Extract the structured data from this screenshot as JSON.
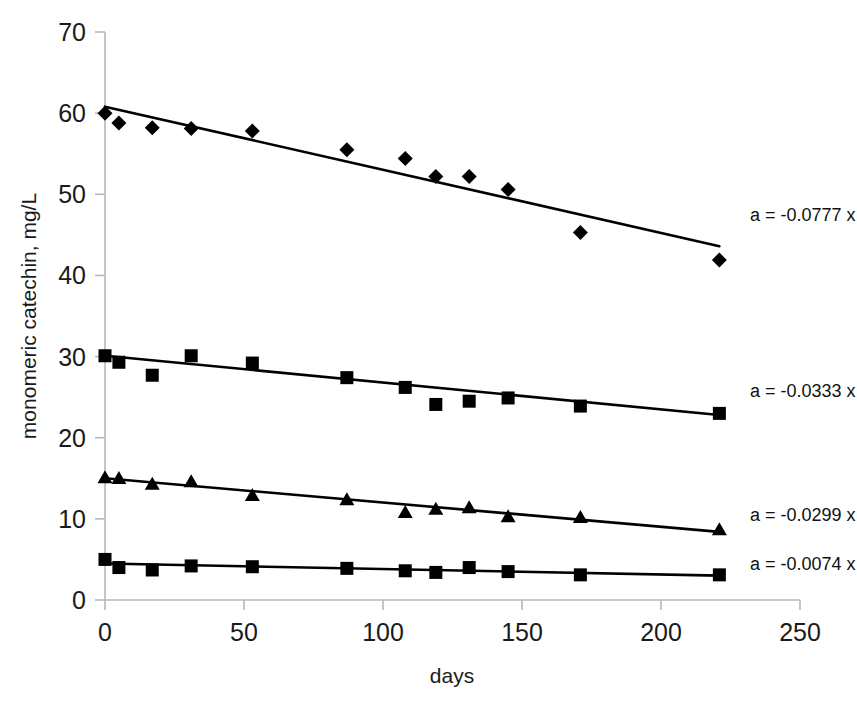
{
  "chart_data": {
    "type": "scatter",
    "title": "",
    "xlabel": "days",
    "ylabel": "monomeric catechin, mg/L",
    "xlim": [
      0,
      250
    ],
    "ylim": [
      0,
      70
    ],
    "xticks": [
      0,
      50,
      100,
      150,
      200,
      250
    ],
    "yticks": [
      0,
      10,
      20,
      30,
      40,
      50,
      60,
      70
    ],
    "grid": false,
    "legend": "none",
    "series": [
      {
        "name": "series-diamond",
        "marker": "diamond",
        "annotation": "a = -0.0777 x",
        "slope": -0.0777,
        "intercept": 60.8,
        "fit_x": [
          0,
          221
        ],
        "fit_y": [
          60.8,
          43.6
        ],
        "points": [
          {
            "x": 0,
            "y": 60.0
          },
          {
            "x": 5,
            "y": 58.8
          },
          {
            "x": 17,
            "y": 58.2
          },
          {
            "x": 31,
            "y": 58.1
          },
          {
            "x": 53,
            "y": 57.8
          },
          {
            "x": 87,
            "y": 55.5
          },
          {
            "x": 108,
            "y": 54.4
          },
          {
            "x": 119,
            "y": 52.2
          },
          {
            "x": 131,
            "y": 52.2
          },
          {
            "x": 145,
            "y": 50.6
          },
          {
            "x": 171,
            "y": 45.3
          },
          {
            "x": 221,
            "y": 41.9
          }
        ]
      },
      {
        "name": "series-square-upper",
        "marker": "square",
        "annotation": "a = -0.0333 x",
        "slope": -0.0333,
        "intercept": 30.1,
        "fit_x": [
          0,
          221
        ],
        "fit_y": [
          30.1,
          22.8
        ],
        "points": [
          {
            "x": 0,
            "y": 30.1
          },
          {
            "x": 5,
            "y": 29.3
          },
          {
            "x": 17,
            "y": 27.7
          },
          {
            "x": 31,
            "y": 30.1
          },
          {
            "x": 53,
            "y": 29.2
          },
          {
            "x": 87,
            "y": 27.4
          },
          {
            "x": 108,
            "y": 26.2
          },
          {
            "x": 119,
            "y": 24.1
          },
          {
            "x": 131,
            "y": 24.5
          },
          {
            "x": 145,
            "y": 24.9
          },
          {
            "x": 171,
            "y": 23.9
          },
          {
            "x": 221,
            "y": 23.0
          }
        ]
      },
      {
        "name": "series-triangle",
        "marker": "triangle",
        "annotation": "a = -0.0299 x",
        "slope": -0.0299,
        "intercept": 15.0,
        "fit_x": [
          0,
          221
        ],
        "fit_y": [
          15.0,
          8.4
        ],
        "points": [
          {
            "x": 0,
            "y": 15.0
          },
          {
            "x": 5,
            "y": 14.9
          },
          {
            "x": 17,
            "y": 14.2
          },
          {
            "x": 31,
            "y": 14.5
          },
          {
            "x": 53,
            "y": 12.8
          },
          {
            "x": 87,
            "y": 12.3
          },
          {
            "x": 108,
            "y": 10.7
          },
          {
            "x": 119,
            "y": 11.1
          },
          {
            "x": 131,
            "y": 11.3
          },
          {
            "x": 145,
            "y": 10.2
          },
          {
            "x": 171,
            "y": 10.1
          },
          {
            "x": 221,
            "y": 8.6
          }
        ]
      },
      {
        "name": "series-square-lower",
        "marker": "square",
        "annotation": "a = -0.0074 x",
        "slope": -0.0074,
        "intercept": 4.5,
        "fit_x": [
          0,
          221
        ],
        "fit_y": [
          4.5,
          3.0
        ],
        "points": [
          {
            "x": 0,
            "y": 5.0
          },
          {
            "x": 5,
            "y": 4.0
          },
          {
            "x": 17,
            "y": 3.7
          },
          {
            "x": 31,
            "y": 4.2
          },
          {
            "x": 53,
            "y": 4.1
          },
          {
            "x": 87,
            "y": 3.9
          },
          {
            "x": 108,
            "y": 3.6
          },
          {
            "x": 119,
            "y": 3.4
          },
          {
            "x": 131,
            "y": 4.0
          },
          {
            "x": 145,
            "y": 3.5
          },
          {
            "x": 171,
            "y": 3.1
          },
          {
            "x": 221,
            "y": 3.1
          }
        ]
      }
    ],
    "annotations": [
      {
        "text": "a = -0.0777 x",
        "x": 232,
        "y": 47.5
      },
      {
        "text": "a = -0.0333 x",
        "x": 232,
        "y": 25.8
      },
      {
        "text": "a = -0.0299 x",
        "x": 232,
        "y": 10.5
      },
      {
        "text": "a = -0.0074 x",
        "x": 232,
        "y": 4.4
      }
    ]
  }
}
